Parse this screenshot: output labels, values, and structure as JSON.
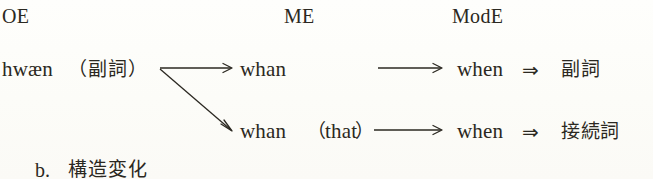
{
  "figure": {
    "caption_below": {
      "marker": "b.",
      "label": "構造変化"
    },
    "columns": [
      {
        "id": "oe",
        "label": "OE"
      },
      {
        "id": "me",
        "label": "ME"
      },
      {
        "id": "mode",
        "label": "ModE"
      }
    ],
    "source": {
      "word": "hwæn",
      "gloss_open_paren": "（",
      "gloss": "副詞",
      "gloss_close_paren": "）"
    },
    "branches": [
      {
        "id": "adverb-branch",
        "me_form": "whan",
        "me_particle": "",
        "modern_form": "when",
        "implies_symbol": "⇒",
        "result_label": "副詞"
      },
      {
        "id": "conjunction-branch",
        "me_form": "whan",
        "me_particle_open_paren": "（",
        "me_particle": "that",
        "me_particle_close_paren": "）",
        "modern_form": "when",
        "implies_symbol": "⇒",
        "result_label": "接続詞"
      }
    ],
    "arrows": [
      {
        "id": "oe-to-me-adverb",
        "kind": "single-arrow-horizontal"
      },
      {
        "id": "oe-to-me-conjunction",
        "kind": "single-arrow-diagonal"
      },
      {
        "id": "me-to-mode-adverb",
        "kind": "single-arrow-horizontal"
      },
      {
        "id": "me-to-mode-conjunction",
        "kind": "single-arrow-horizontal"
      }
    ],
    "colors": {
      "ink": "#2b2821",
      "paper": "#fdfdfa"
    }
  }
}
